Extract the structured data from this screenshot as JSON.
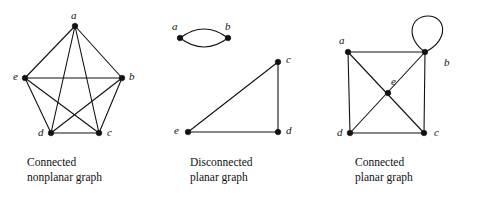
{
  "figure": {
    "background_color": "#ffffff",
    "ink_color": "#111111"
  },
  "panels": [
    {
      "id": "nonplanar",
      "caption_line1": "Connected",
      "caption_line2": "nonplanar graph",
      "graph_type": "complete-graph-K5",
      "vertices": [
        {
          "label": "a",
          "x": 75,
          "y": 26,
          "label_x": 71,
          "label_y": 10
        },
        {
          "label": "b",
          "x": 122,
          "y": 78,
          "label_x": 129,
          "label_y": 71
        },
        {
          "label": "c",
          "x": 99,
          "y": 133,
          "label_x": 107,
          "label_y": 127
        },
        {
          "label": "d",
          "x": 51,
          "y": 133,
          "label_x": 38,
          "label_y": 127
        },
        {
          "label": "e",
          "x": 25,
          "y": 78,
          "label_x": 13,
          "label_y": 71
        }
      ],
      "edges": [
        {
          "from": "a",
          "to": "b"
        },
        {
          "from": "a",
          "to": "c"
        },
        {
          "from": "a",
          "to": "d"
        },
        {
          "from": "a",
          "to": "e"
        },
        {
          "from": "b",
          "to": "c"
        },
        {
          "from": "b",
          "to": "d"
        },
        {
          "from": "b",
          "to": "e"
        },
        {
          "from": "c",
          "to": "d"
        },
        {
          "from": "c",
          "to": "e"
        },
        {
          "from": "d",
          "to": "e"
        }
      ],
      "edge_count": 10,
      "vertex_count": 5
    },
    {
      "id": "disconnected",
      "caption_line1": "Disconnected",
      "caption_line2": "planar graph",
      "graph_type": "two-components-lens-and-triangle",
      "vertices": [
        {
          "label": "a",
          "x": 180,
          "y": 38,
          "label_x": 172,
          "label_y": 21
        },
        {
          "label": "b",
          "x": 228,
          "y": 38,
          "label_x": 225,
          "label_y": 21
        },
        {
          "label": "c",
          "x": 278,
          "y": 62,
          "label_x": 286,
          "label_y": 54
        },
        {
          "label": "d",
          "x": 278,
          "y": 132,
          "label_x": 286,
          "label_y": 125
        },
        {
          "label": "e",
          "x": 188,
          "y": 132,
          "label_x": 174,
          "label_y": 125
        }
      ],
      "edges": [
        {
          "from": "a",
          "to": "b",
          "style": "arc-up"
        },
        {
          "from": "a",
          "to": "b",
          "style": "arc-down"
        },
        {
          "from": "c",
          "to": "d",
          "style": "straight"
        },
        {
          "from": "d",
          "to": "e",
          "style": "straight"
        },
        {
          "from": "e",
          "to": "c",
          "style": "straight"
        }
      ],
      "edge_count": 5,
      "vertex_count": 5
    },
    {
      "id": "planar",
      "caption_line1": "Connected",
      "caption_line2": "planar graph",
      "graph_type": "square-with-center-and-self-loop",
      "vertices": [
        {
          "label": "a",
          "x": 348,
          "y": 52,
          "label_x": 339,
          "label_y": 35
        },
        {
          "label": "b",
          "x": 425,
          "y": 52,
          "label_x": 444,
          "label_y": 57
        },
        {
          "label": "c",
          "x": 424,
          "y": 133,
          "label_x": 434,
          "label_y": 127
        },
        {
          "label": "d",
          "x": 350,
          "y": 133,
          "label_x": 337,
          "label_y": 127
        },
        {
          "label": "e",
          "x": 388,
          "y": 93,
          "label_x": 391,
          "label_y": 76
        }
      ],
      "edges": [
        {
          "from": "a",
          "to": "b",
          "style": "straight"
        },
        {
          "from": "b",
          "to": "c",
          "style": "straight"
        },
        {
          "from": "c",
          "to": "d",
          "style": "straight"
        },
        {
          "from": "d",
          "to": "a",
          "style": "straight"
        },
        {
          "from": "a",
          "to": "c",
          "style": "diagonal-through-e"
        },
        {
          "from": "d",
          "to": "b",
          "style": "diagonal-through-e"
        },
        {
          "from": "b",
          "to": "b",
          "style": "self-loop"
        }
      ],
      "edge_count": 7,
      "vertex_count": 5,
      "self_loop": {
        "at": "b",
        "center_x": 428,
        "center_y": 34,
        "radius": 16
      }
    }
  ]
}
